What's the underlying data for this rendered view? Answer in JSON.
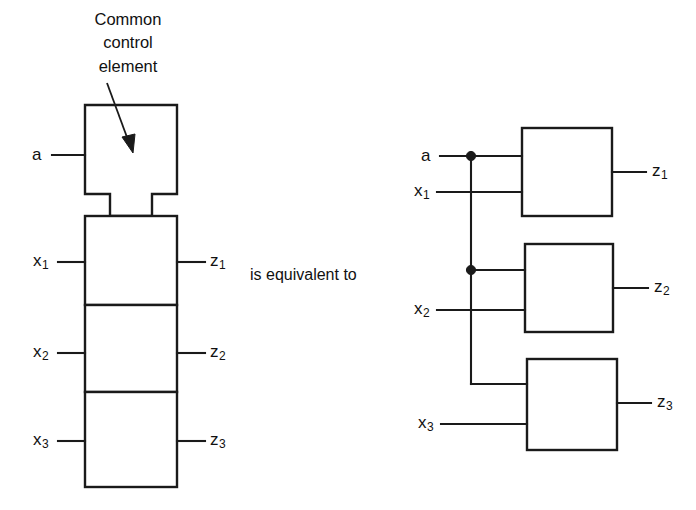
{
  "figure": {
    "annotation": {
      "text": "Common\ncontrol\nelement",
      "pointer_name": "leader-arrow"
    },
    "equivalence_caption": "is equivalent to",
    "left_circuit": {
      "name": "stacked-common-control-form",
      "control_block_label": "",
      "inputs": [
        {
          "id": "a",
          "base": "a",
          "sub": ""
        },
        {
          "id": "x1",
          "base": "x",
          "sub": "1"
        },
        {
          "id": "x2",
          "base": "x",
          "sub": "2"
        },
        {
          "id": "x3",
          "base": "x",
          "sub": "3"
        }
      ],
      "outputs": [
        {
          "id": "z1",
          "base": "z",
          "sub": "1"
        },
        {
          "id": "z2",
          "base": "z",
          "sub": "2"
        },
        {
          "id": "z3",
          "base": "z",
          "sub": "3"
        }
      ],
      "cells": [
        {
          "name": "cell-1",
          "input": "x1",
          "output": "z1"
        },
        {
          "name": "cell-2",
          "input": "x2",
          "output": "z2"
        },
        {
          "name": "cell-3",
          "input": "x3",
          "output": "z3"
        }
      ]
    },
    "right_circuit": {
      "name": "expanded-separate-blocks-form",
      "inputs": [
        {
          "id": "a",
          "base": "a",
          "sub": ""
        },
        {
          "id": "x1",
          "base": "x",
          "sub": "1"
        },
        {
          "id": "x2",
          "base": "x",
          "sub": "2"
        },
        {
          "id": "x3",
          "base": "x",
          "sub": "3"
        }
      ],
      "outputs": [
        {
          "id": "z1",
          "base": "z",
          "sub": "1"
        },
        {
          "id": "z2",
          "base": "z",
          "sub": "2"
        },
        {
          "id": "z3",
          "base": "z",
          "sub": "3"
        }
      ],
      "blocks": [
        {
          "name": "block-1",
          "inputs": [
            "a",
            "x1"
          ],
          "output": "z1"
        },
        {
          "name": "block-2",
          "inputs": [
            "a",
            "x2"
          ],
          "output": "z2"
        },
        {
          "name": "block-3",
          "inputs": [
            "a",
            "x3"
          ],
          "output": "z3"
        }
      ],
      "junction_dots": 2
    },
    "colors": {
      "ink": "#1a1a1a",
      "background": "#ffffff"
    }
  }
}
